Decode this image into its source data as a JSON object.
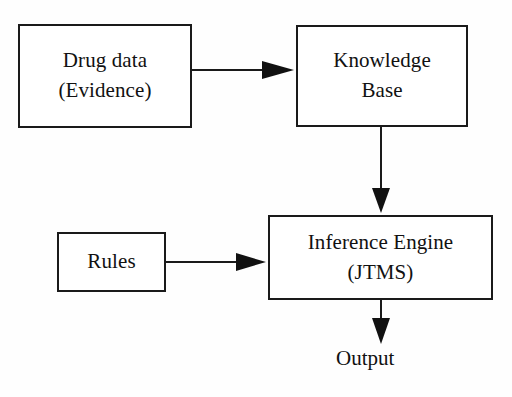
{
  "diagram": {
    "canvas": {
      "width": 512,
      "height": 397
    },
    "colors": {
      "background": "#fefefe",
      "box_fill": "#ffffff",
      "stroke": "#1a1a1a",
      "text": "#111111"
    },
    "nodes": [
      {
        "id": "drug-data",
        "line1": "Drug data",
        "line2": "(Evidence)",
        "x": 18,
        "y": 24,
        "width": 174,
        "height": 104
      },
      {
        "id": "knowledge-base",
        "line1": "Knowledge",
        "line2": "Base",
        "x": 296,
        "y": 25,
        "width": 172,
        "height": 102
      },
      {
        "id": "rules",
        "line1": "Rules",
        "line2": "",
        "x": 57,
        "y": 232,
        "width": 109,
        "height": 60
      },
      {
        "id": "inference-engine",
        "line1": "Inference Engine",
        "line2": "(JTMS)",
        "x": 268,
        "y": 215,
        "width": 225,
        "height": 85
      }
    ],
    "labels": [
      {
        "id": "output",
        "text": "Output",
        "x": 336,
        "y": 346
      }
    ],
    "edges": [
      {
        "id": "drug-data-to-knowledge-base",
        "from": "drug-data",
        "to": "knowledge-base",
        "orientation": "horizontal",
        "x1": 192,
        "y1": 70,
        "x2": 294,
        "y2": 70
      },
      {
        "id": "knowledge-base-to-inference-engine",
        "from": "knowledge-base",
        "to": "inference-engine",
        "orientation": "vertical",
        "x1": 381,
        "y1": 127,
        "x2": 381,
        "y2": 213
      },
      {
        "id": "rules-to-inference-engine",
        "from": "rules",
        "to": "inference-engine",
        "orientation": "horizontal",
        "x1": 166,
        "y1": 262,
        "x2": 266,
        "y2": 262
      },
      {
        "id": "inference-engine-to-output",
        "from": "inference-engine",
        "to": "output",
        "orientation": "vertical",
        "x1": 381,
        "y1": 300,
        "x2": 381,
        "y2": 344
      }
    ]
  }
}
